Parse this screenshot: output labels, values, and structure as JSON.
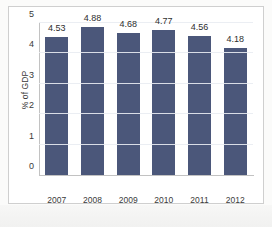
{
  "chart_data": {
    "type": "bar",
    "title": "",
    "subtitle": "",
    "xlabel": "",
    "ylabel": "% of GDP",
    "categories": [
      "2007",
      "2008",
      "2009",
      "2010",
      "2011",
      "2012"
    ],
    "values": [
      4.53,
      4.88,
      4.68,
      4.77,
      4.56,
      4.18
    ],
    "value_labels": [
      "4.53",
      "4.88",
      "4.68",
      "4.77",
      "4.56",
      "4.18"
    ],
    "ylim": [
      0,
      5
    ],
    "y_ticks": [
      0,
      1,
      2,
      3,
      4,
      5
    ],
    "y_tick_labels": [
      "0",
      "1",
      "2",
      "3",
      "4",
      "5"
    ],
    "grid": true,
    "grid_axis": "y",
    "legend": false,
    "legend_position": "none",
    "series": [
      {
        "name": "% of GDP",
        "values": [
          4.53,
          4.88,
          4.68,
          4.77,
          4.56,
          4.18
        ]
      }
    ],
    "colors": {
      "bar": "#4b577a",
      "gridline": "#e9ecf2",
      "axis": "#c2c2c2",
      "text": "#3a3a3a",
      "value_text": "#2e2e2e",
      "plot_background": "#ffffff",
      "frame_border": "#cfcfcf",
      "page_background": "#fbfbfa"
    }
  }
}
